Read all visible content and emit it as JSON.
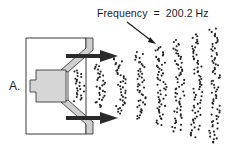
{
  "figure": {
    "panel_label": "A.",
    "annotation": {
      "label": "Frequency",
      "equals": "=",
      "value": "200.2",
      "unit": "Hz",
      "full_text": "Frequency  =  200.2 Hz"
    },
    "components": {
      "speaker": "loudspeaker-cross-section",
      "arrows": [
        "upper-direction-arrow",
        "lower-direction-arrow"
      ],
      "sound_wave": "compression-bands-of-air-particles"
    },
    "wave_bands": [
      {
        "x": 80,
        "half_height": 16,
        "count": 24
      },
      {
        "x": 101,
        "half_height": 22,
        "count": 32
      },
      {
        "x": 122,
        "half_height": 28,
        "count": 40
      },
      {
        "x": 142,
        "half_height": 34,
        "count": 46
      },
      {
        "x": 162,
        "half_height": 40,
        "count": 54
      },
      {
        "x": 180,
        "half_height": 46,
        "count": 60
      },
      {
        "x": 198,
        "half_height": 52,
        "count": 66
      },
      {
        "x": 216,
        "half_height": 58,
        "count": 72
      }
    ],
    "colors": {
      "outline": "#3a3a3a",
      "cone_fill": "#cfcfcf",
      "magnet_fill": "#d6d6d6",
      "arrow": "#2a2a2a",
      "dots": "#222222",
      "background": "#ffffff"
    }
  }
}
